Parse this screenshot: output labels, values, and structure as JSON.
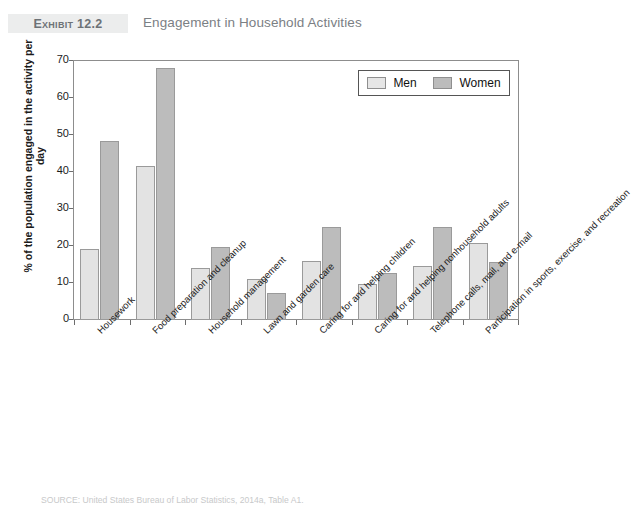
{
  "header": {
    "exhibit_badge": "Exhibit 12.2",
    "title": "Engagement in Household Activities"
  },
  "source_note": "SOURCE: United States Bureau of Labor Statistics, 2014a, Table A1.",
  "legend": {
    "men_label": "Men",
    "women_label": "Women",
    "men_color": "#e6e6e6",
    "women_color": "#bcbcbc"
  },
  "axis": {
    "y_title": "% of the population engaged in the activity per day",
    "y_ticks": [
      "0",
      "10",
      "20",
      "30",
      "40",
      "50",
      "60",
      "70"
    ]
  },
  "chart_data": {
    "type": "bar",
    "title": "Engagement in Household Activities",
    "xlabel": "",
    "ylabel": "% of the population engaged in the activity per day",
    "ylim": [
      0,
      70
    ],
    "ytick_step": 10,
    "grid": false,
    "legend_position": "top-right",
    "categories": [
      "Housework",
      "Food preparation and cleanup",
      "Household management",
      "Lawn and garden care",
      "Caring for and helping children",
      "Caring for and helping nonhousehold adults",
      "Telephone calls, mail, and e-mail",
      "Participation in sports, exercise, and recreation"
    ],
    "series": [
      {
        "name": "Men",
        "color": "#e6e6e6",
        "values": [
          19.3,
          41.5,
          14.1,
          11.2,
          15.9,
          9.8,
          14.7,
          20.8
        ]
      },
      {
        "name": "Women",
        "color": "#bcbcbc",
        "values": [
          48.5,
          68.0,
          19.8,
          7.2,
          25.2,
          12.6,
          25.2,
          15.8
        ]
      }
    ]
  }
}
